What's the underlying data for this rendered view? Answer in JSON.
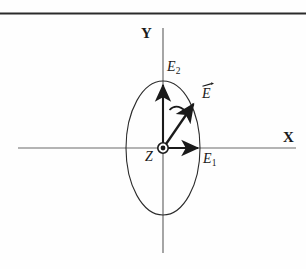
{
  "figure": {
    "kind": "physics-vector-diagram",
    "background_color": "#fefefe",
    "ink_color": "#1a1a1a",
    "axis_color": "#555555",
    "curve_color": "#2b2b2b",
    "rule": {
      "name": "top-rule",
      "color": "#2a2a2a"
    },
    "labels": {
      "x_axis": "X",
      "y_axis": "Y",
      "z_axis": "Z",
      "e_component_1": "E",
      "e_component_1_sub": "1",
      "e_component_2": "E",
      "e_component_2_sub": "2",
      "e_vector": "E"
    },
    "geometry": {
      "origin": [
        163,
        148
      ],
      "ellipse_semi_x": 37,
      "ellipse_semi_y": 67,
      "x_axis_span": [
        18,
        296
      ],
      "y_axis_span": [
        28,
        253
      ],
      "e1_arrow_tip": [
        202,
        148
      ],
      "e2_arrow_tip": [
        163,
        81
      ],
      "e_vector_tip": [
        197,
        100
      ]
    }
  }
}
